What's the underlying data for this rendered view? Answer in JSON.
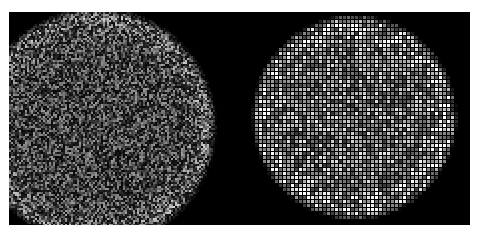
{
  "figure": {
    "background": "#ffffff",
    "frame_color": "#000000",
    "frame": {
      "x": 9,
      "y": 12,
      "w": 461,
      "h": 213
    },
    "panels": [
      {
        "name": "left-noisy-disc",
        "description": "fine-grained speckle disc, clipped at left edge",
        "center": [
          88,
          115
        ],
        "radius": 118,
        "grain_px": 2,
        "brightness": 0.55,
        "rim_boost": 0.25,
        "clip": {
          "x0": 0,
          "x1": 230
        }
      },
      {
        "name": "right-pixelated-disc",
        "description": "coarse pixelated bright disc with grid pattern",
        "center": [
          346,
          106
        ],
        "radius": 101,
        "grain_px": 4,
        "brightness": 0.7,
        "rim_boost": 0.3,
        "clip": {
          "x0": 230,
          "x1": 461
        }
      }
    ]
  }
}
